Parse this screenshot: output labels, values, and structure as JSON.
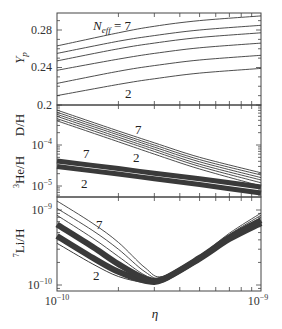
{
  "chart_data": [
    {
      "type": "line",
      "panel": "top",
      "ylabel": "Y_p",
      "yscale": "linear",
      "ylim": [
        0.2,
        0.3
      ],
      "yticks": [
        {
          "value": 0.2,
          "label": "0.2"
        },
        {
          "value": 0.24,
          "label": "0.24"
        },
        {
          "value": 0.28,
          "label": "0.28"
        }
      ],
      "x": [
        1e-10,
        2e-10,
        3e-10,
        5e-10,
        1e-09
      ],
      "series": [
        {
          "name": "N_eff = 2",
          "values": [
            0.21,
            0.222,
            0.228,
            0.234,
            0.239
          ]
        },
        {
          "name": "N_eff = 3",
          "values": [
            0.223,
            0.236,
            0.242,
            0.248,
            0.253
          ]
        },
        {
          "name": "N_eff = 4",
          "values": [
            0.237,
            0.249,
            0.255,
            0.261,
            0.266
          ]
        },
        {
          "name": "N_eff = 5",
          "values": [
            0.247,
            0.26,
            0.266,
            0.272,
            0.277
          ]
        },
        {
          "name": "N_eff = 6",
          "values": [
            0.255,
            0.268,
            0.274,
            0.28,
            0.285
          ]
        },
        {
          "name": "N_eff = 7",
          "values": [
            0.263,
            0.277,
            0.284,
            0.29,
            0.295
          ]
        }
      ],
      "annotations": [
        {
          "text_main": "N",
          "text_sub": "eff",
          "text_tail": " = 7",
          "near": "N_eff = 7 curve"
        },
        {
          "text": "2",
          "near": "N_eff = 2 curve"
        }
      ]
    },
    {
      "type": "line",
      "panel": "middle",
      "ylabel": "D/H, ³He/H",
      "ylabel_parts": {
        "dh": "D/H",
        "he_sup": "3",
        "he": "He/H"
      },
      "yscale": "log",
      "ylim": [
        6e-06,
        0.00095
      ],
      "yticks": [
        {
          "value": 1e-05,
          "label_base": "10",
          "label_exp": "−5"
        },
        {
          "value": 0.0001,
          "label_base": "10",
          "label_exp": "−4"
        }
      ],
      "x": [
        1e-10,
        2e-10,
        3e-10,
        5e-10,
        1e-09
      ],
      "series": [
        {
          "name": "D/H N_eff = 2",
          "values": [
            0.00039,
            0.00012,
            6e-05,
            2.6e-05,
            1e-05
          ]
        },
        {
          "name": "D/H N_eff = 3",
          "values": [
            0.00044,
            0.000138,
            7e-05,
            3e-05,
            1.2e-05
          ]
        },
        {
          "name": "D/H N_eff = 4",
          "values": [
            0.0005,
            0.000155,
            7.9e-05,
            3.4e-05,
            1.4e-05
          ]
        },
        {
          "name": "D/H N_eff = 5",
          "values": [
            0.00056,
            0.000175,
            8.9e-05,
            3.9e-05,
            1.6e-05
          ]
        },
        {
          "name": "D/H N_eff = 6",
          "values": [
            0.00063,
            0.000195,
            0.0001,
            4.4e-05,
            1.85e-05
          ]
        },
        {
          "name": "D/H N_eff = 7",
          "values": [
            0.00071,
            0.00022,
            0.000113,
            5e-05,
            2.1e-05
          ]
        },
        {
          "name": "3He/H N_eff = 2",
          "values": [
            3e-05,
            1.95e-05,
            1.5e-05,
            1.08e-05,
            6.8e-06
          ]
        },
        {
          "name": "3He/H N_eff = 7",
          "values": [
            4.1e-05,
            2.65e-05,
            2.05e-05,
            1.5e-05,
            9.5e-06
          ]
        }
      ],
      "annotations": [
        {
          "text": "7",
          "near": "D/H N_eff = 7"
        },
        {
          "text": "2",
          "near": "D/H N_eff = 2"
        },
        {
          "text": "7",
          "near": "3He/H N_eff = 7"
        },
        {
          "text": "2",
          "near": "3He/H N_eff = 2"
        }
      ]
    },
    {
      "type": "line",
      "panel": "bottom",
      "ylabel": "⁷Li/H",
      "ylabel_parts": {
        "sup": "7",
        "main": "Li/H"
      },
      "yscale": "log",
      "ylim": [
        9e-11,
        1.35e-09
      ],
      "yticks": [
        {
          "value": 1e-10,
          "label_base": "10",
          "label_exp": "−10"
        },
        {
          "value": 1e-09,
          "label_base": "10",
          "label_exp": "−9"
        }
      ],
      "x": [
        1e-10,
        1.5e-10,
        2e-10,
        2.7e-10,
        3.3e-10,
        5e-10,
        7e-10,
        1e-09
      ],
      "series": [
        {
          "name": "N_eff = 2",
          "values": [
            3.6e-10,
            1.9e-10,
            1.3e-10,
            1.08e-10,
            1.15e-10,
            2.2e-10,
            4e-10,
            6.3e-10
          ]
        },
        {
          "name": "N_eff = 3",
          "values": [
            4.5e-10,
            2.3e-10,
            1.5e-10,
            1.14e-10,
            1.18e-10,
            2.25e-10,
            4.1e-10,
            6.7e-10
          ]
        },
        {
          "name": "N_eff = 4",
          "values": [
            6.4e-10,
            3.2e-10,
            1.9e-10,
            1.22e-10,
            1.2e-10,
            2.3e-10,
            4.3e-10,
            7.3e-10
          ]
        },
        {
          "name": "N_eff = 5",
          "values": [
            8.5e-10,
            4.2e-10,
            2.4e-10,
            1.35e-10,
            1.22e-10,
            2.35e-10,
            4.5e-10,
            7.9e-10
          ]
        },
        {
          "name": "N_eff = 6",
          "values": [
            1.05e-09,
            5.3e-10,
            3e-10,
            1.5e-10,
            1.25e-10,
            2.4e-10,
            4.7e-10,
            8.5e-10
          ]
        },
        {
          "name": "N_eff = 7",
          "values": [
            1.32e-09,
            6.6e-10,
            3.7e-10,
            1.7e-10,
            1.3e-10,
            2.45e-10,
            4.9e-10,
            9.1e-10
          ]
        }
      ],
      "annotations": [
        {
          "text": "7",
          "near": "N_eff = 7"
        },
        {
          "text": "2",
          "near": "N_eff = 2"
        }
      ]
    }
  ],
  "xaxis": {
    "label": "η",
    "scale": "log",
    "xlim": [
      1e-10,
      1e-09
    ],
    "ticks": [
      {
        "value": 1e-10,
        "label_base": "10",
        "label_exp": "−10"
      },
      {
        "value": 1e-09,
        "label_base": "10",
        "label_exp": "−9"
      }
    ]
  },
  "labels": {
    "yp_main": "Y",
    "yp_sub": "p",
    "dh": "D/H",
    "he_sup": "3",
    "he_main": "He/H",
    "li_sup": "7",
    "li_main": "Li/H",
    "eta": "η",
    "neff_n": "N",
    "neff_sub": "eff",
    "neff_tail": " = 7",
    "n7": "7",
    "n2": "2",
    "tick_028": "0.28",
    "tick_024": "0.24",
    "tick_02": "0.2",
    "ten": "10",
    "exp_m4": "−4",
    "exp_m5": "−5",
    "exp_m9": "−9",
    "exp_m10": "−10"
  },
  "colors": {
    "line": "#3a3a3a",
    "band": "#2e2e2e",
    "frame": "#444444",
    "text": "#222222"
  }
}
